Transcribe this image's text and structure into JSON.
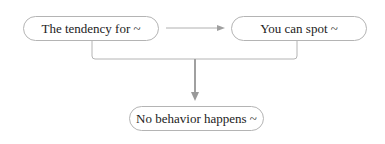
{
  "diagram": {
    "nodes": [
      {
        "id": "n1",
        "label": "The tendency for ~"
      },
      {
        "id": "n2",
        "label": "You can spot ~"
      },
      {
        "id": "n3",
        "label": "No behavior happens ~"
      }
    ],
    "edges": [
      {
        "from": "n1",
        "to": "n2",
        "type": "arrow"
      },
      {
        "from": [
          "n1",
          "n2"
        ],
        "to": "n3",
        "type": "merge-arrow"
      }
    ],
    "colors": {
      "border": "#b4b4b4",
      "line": "#a8a8a8",
      "arrow": "#999999",
      "text": "#222222"
    }
  }
}
